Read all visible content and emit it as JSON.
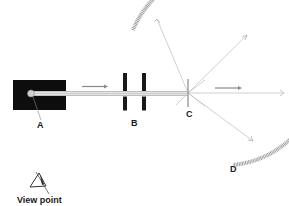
{
  "diagram": {
    "labels": {
      "A": "A",
      "B": "B",
      "C": "C",
      "D": "D",
      "viewpoint": "View point"
    },
    "components": {
      "A": "radioactive source in lead block",
      "B": "collimating slits",
      "C": "thin foil target",
      "D": "circular detection screen"
    },
    "colors": {
      "source_block": "#0d0d0d",
      "beam": "#b8b8b8",
      "slits": "#1a1a1a",
      "screen": "#9a9a9a",
      "rays": "#c4c4c4",
      "arrows": "#888888",
      "text": "#1a1a1a"
    }
  }
}
